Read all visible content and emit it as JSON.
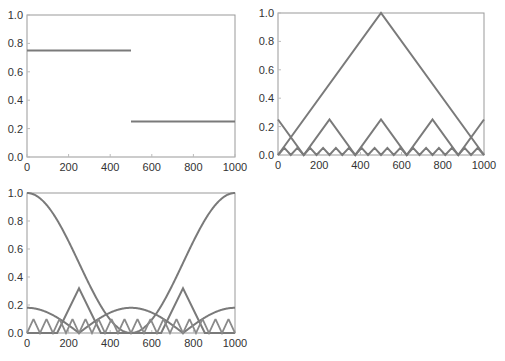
{
  "chart_data": [
    {
      "type": "line",
      "title": "",
      "xlabel": "",
      "ylabel": "",
      "xlim": [
        0,
        1000
      ],
      "ylim": [
        0,
        1.0
      ],
      "xticks": [
        "0",
        "200",
        "400",
        "600",
        "800",
        "1000"
      ],
      "yticks": [
        "0.0",
        "0.2",
        "0.4",
        "0.6",
        "0.8",
        "1.0"
      ],
      "grid": false,
      "series": [
        {
          "name": "step",
          "x": [
            0,
            500,
            500,
            1000
          ],
          "values": [
            0.75,
            0.75,
            0.25,
            0.25
          ]
        }
      ]
    },
    {
      "type": "line",
      "title": "",
      "xlabel": "",
      "ylabel": "",
      "xlim": [
        0,
        1000
      ],
      "ylim": [
        0,
        1.0
      ],
      "xticks": [
        "0",
        "200",
        "400",
        "600",
        "800",
        "1000"
      ],
      "yticks": [
        "0.0",
        "0.2",
        "0.4",
        "0.6",
        "0.8",
        "1.0"
      ],
      "grid": false,
      "series": [
        {
          "name": "triangle-1",
          "x": [
            0,
            500,
            1000
          ],
          "values": [
            0,
            1.0,
            0
          ]
        },
        {
          "name": "triangle-2",
          "x": [
            0,
            125,
            250,
            375,
            500,
            625,
            750,
            875,
            1000
          ],
          "values": [
            0.25,
            0,
            0.25,
            0,
            0.25,
            0,
            0.25,
            0,
            0.25
          ]
        },
        {
          "name": "triangle-3",
          "x": [
            0,
            31,
            62,
            94,
            125,
            156,
            187,
            219,
            250,
            281,
            312,
            344,
            375,
            406,
            437,
            469,
            500,
            531,
            562,
            594,
            625,
            656,
            687,
            719,
            750,
            781,
            812,
            844,
            875,
            906,
            937,
            969,
            1000
          ],
          "values": [
            0,
            0.05,
            0,
            0.05,
            0,
            0.05,
            0,
            0.05,
            0,
            0.05,
            0,
            0.05,
            0,
            0.05,
            0,
            0.05,
            0,
            0.05,
            0,
            0.05,
            0,
            0.05,
            0,
            0.05,
            0,
            0.05,
            0,
            0.05,
            0,
            0.05,
            0,
            0.05,
            0
          ]
        }
      ]
    },
    {
      "type": "line",
      "title": "",
      "xlabel": "",
      "ylabel": "",
      "xlim": [
        0,
        1000
      ],
      "ylim": [
        0,
        1.0
      ],
      "xticks": [
        "0",
        "200",
        "400",
        "600",
        "800",
        "1000"
      ],
      "yticks": [
        "0.0",
        "0.2",
        "0.4",
        "0.6",
        "0.8",
        "1.0"
      ],
      "grid": false,
      "series": [
        {
          "name": "cos-squared",
          "x": [
            0,
            125,
            250,
            375,
            500,
            625,
            750,
            875,
            1000
          ],
          "values": [
            1.0,
            0.85,
            0.5,
            0.15,
            0.0,
            0.15,
            0.5,
            0.85,
            1.0
          ]
        },
        {
          "name": "rounded-lobes",
          "x": [
            0,
            125,
            250,
            375,
            500,
            625,
            750,
            875,
            1000
          ],
          "values": [
            0.18,
            0.09,
            0.0,
            0.09,
            0.18,
            0.09,
            0.0,
            0.09,
            0.18
          ]
        },
        {
          "name": "peaked-triangles",
          "x": [
            0,
            145,
            250,
            355,
            500,
            645,
            750,
            855,
            1000
          ],
          "values": [
            0.0,
            0.0,
            0.32,
            0.0,
            0.0,
            0.0,
            0.32,
            0.0,
            0.0
          ]
        },
        {
          "name": "small-triangles",
          "peak": 0.1
        }
      ]
    }
  ]
}
